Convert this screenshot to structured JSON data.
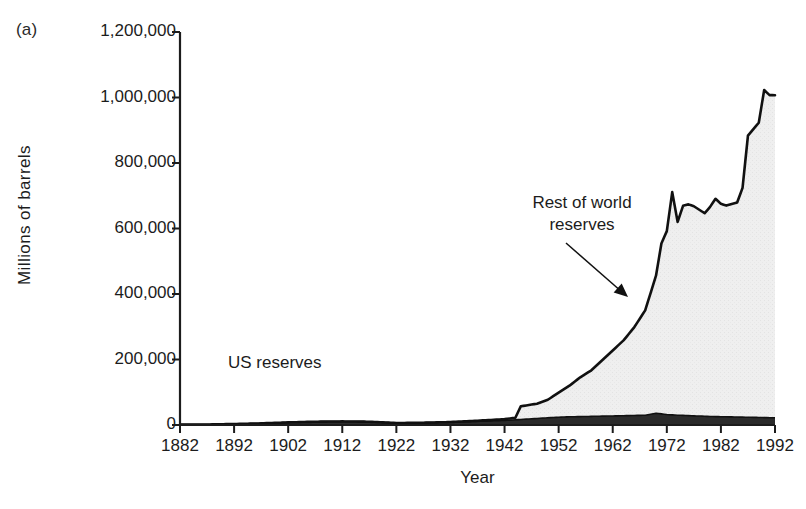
{
  "figure": {
    "panel_label": "(a)",
    "xlabel": "Year",
    "ylabel": "Millions of barrels"
  },
  "annotations": {
    "world": "Rest of world\nreserves",
    "world_line1": "Rest of world",
    "world_line2": "reserves",
    "us": "US reserves"
  },
  "colors": {
    "line": "#111111",
    "world_fill": "#efefef",
    "us_fill": "#2b2b2b",
    "axis": "#1c1c1c",
    "text": "#1c1c1c"
  },
  "chart_data": {
    "type": "area",
    "title": "",
    "subtitle": "",
    "xlabel": "Year",
    "ylabel": "Millions of barrels",
    "xlim": [
      1882,
      1992
    ],
    "ylim": [
      0,
      1200000
    ],
    "xticks": [
      1882,
      1892,
      1902,
      1912,
      1922,
      1932,
      1942,
      1952,
      1962,
      1972,
      1982,
      1992
    ],
    "yticks": [
      0,
      200000,
      400000,
      600000,
      800000,
      1000000,
      1200000
    ],
    "ytick_labels": [
      "0",
      "200,000",
      "400,000",
      "600,000",
      "800,000",
      "1,000,000",
      "1,200,000"
    ],
    "grid": false,
    "legend": "none",
    "stacked": true,
    "annotations": [
      {
        "text": "Rest of world reserves",
        "x": 1963,
        "y": 520000,
        "arrow_to_x": 1970,
        "arrow_to_y": 345000
      },
      {
        "text": "US reserves",
        "x": 1914,
        "y": 175000
      }
    ],
    "series": [
      {
        "name": "US reserves",
        "fill": "#2b2b2b",
        "x": [
          1882,
          1887,
          1892,
          1897,
          1902,
          1907,
          1912,
          1917,
          1922,
          1927,
          1932,
          1937,
          1942,
          1945,
          1948,
          1951,
          1954,
          1957,
          1960,
          1963,
          1966,
          1968,
          1970,
          1972,
          1974,
          1977,
          1980,
          1983,
          1986,
          1989,
          1992
        ],
        "values": [
          1000,
          1500,
          3000,
          5000,
          8000,
          10000,
          11000,
          10000,
          6000,
          7000,
          9000,
          11000,
          14000,
          17000,
          20000,
          23000,
          25000,
          26000,
          27000,
          28000,
          29000,
          30000,
          36000,
          32000,
          30000,
          28000,
          26000,
          25000,
          24000,
          23000,
          22000
        ]
      },
      {
        "name": "Rest of world reserves",
        "fill": "#efefef",
        "x": [
          1882,
          1892,
          1902,
          1912,
          1922,
          1932,
          1937,
          1942,
          1944,
          1945,
          1948,
          1950,
          1952,
          1954,
          1956,
          1958,
          1960,
          1962,
          1964,
          1966,
          1968,
          1970,
          1971,
          1972,
          1973,
          1974,
          1975,
          1976,
          1977,
          1978,
          1979,
          1980,
          1981,
          1982,
          1983,
          1984,
          1985,
          1986,
          1987,
          1988,
          1989,
          1990,
          1991,
          1992
        ],
        "values": [
          0,
          0,
          0,
          0,
          0,
          0,
          2000,
          4000,
          6000,
          40000,
          45000,
          55000,
          75000,
          95000,
          120000,
          140000,
          170000,
          200000,
          230000,
          270000,
          320000,
          420000,
          520000,
          560000,
          680000,
          590000,
          640000,
          645000,
          640000,
          630000,
          620000,
          640000,
          665000,
          650000,
          645000,
          650000,
          655000,
          700000,
          860000,
          880000,
          900000,
          1000000,
          985000,
          985000
        ]
      }
    ]
  }
}
